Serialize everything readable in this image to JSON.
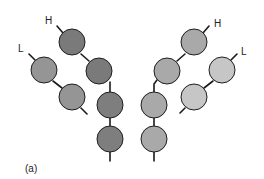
{
  "figure": {
    "panel_label": "(a)",
    "labels": {
      "left_heavy": "H",
      "left_light": "L",
      "right_heavy": "H",
      "right_light": "L"
    }
  },
  "colors": {
    "heavy_dark": "#7a7a7a",
    "heavy_dark_lower": "#7e7e7e",
    "light_mid": "#959595",
    "right_heavy": "#a9a9a9",
    "right_light": "#c6c6c6",
    "outline": "#1e1e1e"
  },
  "domains": {
    "left_heavy_chain": [
      {
        "name": "VH",
        "cx": 72,
        "cy": 42
      },
      {
        "name": "CH1",
        "cx": 99,
        "cy": 71
      },
      {
        "name": "CH2",
        "cx": 110,
        "cy": 105
      },
      {
        "name": "CH3",
        "cx": 110,
        "cy": 139
      }
    ],
    "left_light_chain": [
      {
        "name": "VL",
        "cx": 44,
        "cy": 70
      },
      {
        "name": "CL",
        "cx": 72,
        "cy": 97
      }
    ],
    "right_heavy_chain": [
      {
        "name": "VH",
        "cx": 194,
        "cy": 42
      },
      {
        "name": "CH1",
        "cx": 167,
        "cy": 71
      },
      {
        "name": "CH2",
        "cx": 154,
        "cy": 105
      },
      {
        "name": "CH3",
        "cx": 154,
        "cy": 139
      }
    ],
    "right_light_chain": [
      {
        "name": "VL",
        "cx": 222,
        "cy": 70
      },
      {
        "name": "CL",
        "cx": 194,
        "cy": 97
      }
    ]
  }
}
